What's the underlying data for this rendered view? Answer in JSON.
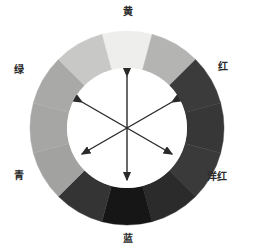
{
  "figure": {
    "background_color": "#ffffff",
    "center": {
      "x": 127,
      "y": 128
    },
    "outer_radius": 97,
    "inner_radius": 60,
    "inner_fill": "#ffffff",
    "segment_count": 12,
    "segment_span_degrees": 30
  },
  "labels": [
    {
      "id": "yellow",
      "text": "黄",
      "position": "top",
      "angle_degrees": 90,
      "color": "#2a2a2a"
    },
    {
      "id": "red",
      "text": "红",
      "position": "upper-right",
      "angle_degrees": 30,
      "color": "#2a2a2a"
    },
    {
      "id": "magenta",
      "text": "洋红",
      "position": "lower-right",
      "angle_degrees": -30,
      "color": "#2a2a2a"
    },
    {
      "id": "blue",
      "text": "蓝",
      "position": "bottom",
      "angle_degrees": -90,
      "color": "#2a2a2a"
    },
    {
      "id": "cyan",
      "text": "青",
      "position": "lower-left",
      "angle_degrees": 210,
      "color": "#2a2a2a"
    },
    {
      "id": "green",
      "text": "绿",
      "position": "upper-left",
      "angle_degrees": 150,
      "color": "#2a2a2a"
    }
  ],
  "chart_data": {
    "type": "pie",
    "xlabel": "",
    "ylabel": "",
    "legend_position": "around-ring",
    "grid": false,
    "categories": [
      "黄",
      "红",
      "洋红",
      "蓝",
      "青",
      "绿"
    ],
    "values": [
      60,
      60,
      60,
      60,
      60,
      60
    ],
    "segments": [
      {
        "index": 0,
        "start_angle": 75,
        "end_angle": 105,
        "fill": "#eeeeec",
        "hue_label": "黄"
      },
      {
        "index": 1,
        "start_angle": 45,
        "end_angle": 75,
        "fill": "#b4b5b3",
        "hue_label": ""
      },
      {
        "index": 2,
        "start_angle": 15,
        "end_angle": 45,
        "fill": "#3b3b3b",
        "hue_label": "红"
      },
      {
        "index": 3,
        "start_angle": -15,
        "end_angle": 15,
        "fill": "#373737",
        "hue_label": ""
      },
      {
        "index": 4,
        "start_angle": -45,
        "end_angle": -15,
        "fill": "#3a3a3a",
        "hue_label": "洋红"
      },
      {
        "index": 5,
        "start_angle": -75,
        "end_angle": -45,
        "fill": "#2b2b2b",
        "hue_label": ""
      },
      {
        "index": 6,
        "start_angle": -105,
        "end_angle": -75,
        "fill": "#161616",
        "hue_label": "蓝"
      },
      {
        "index": 7,
        "start_angle": -135,
        "end_angle": -105,
        "fill": "#343434",
        "hue_label": ""
      },
      {
        "index": 8,
        "start_angle": -165,
        "end_angle": -135,
        "fill": "#a2a3a1",
        "hue_label": "青"
      },
      {
        "index": 9,
        "start_angle": 165,
        "end_angle": -165,
        "fill": "#a6a7a5",
        "hue_label": ""
      },
      {
        "index": 10,
        "start_angle": 135,
        "end_angle": 165,
        "fill": "#a9aaa8",
        "hue_label": "绿"
      },
      {
        "index": 11,
        "start_angle": 105,
        "end_angle": 135,
        "fill": "#c8c9c7",
        "hue_label": ""
      }
    ],
    "arrows": [
      {
        "id": "yellow-blue",
        "angle_degrees": 90,
        "length": 52,
        "double_headed": true,
        "color": "#2a2a2a",
        "connects": [
          "黄",
          "蓝"
        ]
      },
      {
        "id": "red-cyan",
        "angle_degrees": 30,
        "length": 52,
        "double_headed": true,
        "color": "#2a2a2a",
        "connects": [
          "红",
          "青"
        ]
      },
      {
        "id": "green-magenta",
        "angle_degrees": 150,
        "length": 52,
        "double_headed": true,
        "color": "#2a2a2a",
        "connects": [
          "绿",
          "洋红"
        ]
      }
    ]
  }
}
